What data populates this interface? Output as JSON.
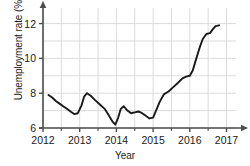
{
  "chart_data": {
    "type": "line",
    "title": "",
    "xlabel": "Year",
    "ylabel": "Unemployment rate (%)",
    "xlim": [
      2012,
      2017.15
    ],
    "ylim": [
      6,
      12.55
    ],
    "xticks": [
      2012,
      2013,
      2014,
      2015,
      2016,
      2017
    ],
    "xtick_labels": [
      "2012",
      "2013",
      "2014",
      "2015",
      "2016",
      "2017"
    ],
    "yticks": [
      6,
      8,
      10,
      12
    ],
    "ytick_labels": [
      "6",
      "8",
      "10",
      "12"
    ],
    "minor_xticks": [
      2012.5,
      2013.5,
      2014.5,
      2015.5,
      2016.5
    ],
    "grid": true,
    "legend": "none",
    "line_color": "#1a1a1a",
    "grid_color": "#d8d8d8",
    "axis_color": "#4d4d4d",
    "series": [
      {
        "name": "Unemployment rate",
        "x": [
          2012.15,
          2012.25,
          2012.35,
          2012.45,
          2012.55,
          2012.65,
          2012.75,
          2012.85,
          2012.95,
          2013.05,
          2013.12,
          2013.2,
          2013.3,
          2013.42,
          2013.55,
          2013.68,
          2013.8,
          2013.9,
          2013.97,
          2014.05,
          2014.12,
          2014.2,
          2014.3,
          2014.4,
          2014.5,
          2014.6,
          2014.7,
          2014.8,
          2014.9,
          2015.0,
          2015.08,
          2015.18,
          2015.3,
          2015.42,
          2015.55,
          2015.68,
          2015.8,
          2015.9,
          2016.0,
          2016.08,
          2016.15,
          2016.25,
          2016.35,
          2016.45,
          2016.55,
          2016.62,
          2016.7,
          2016.8
        ],
        "y": [
          7.9,
          7.75,
          7.55,
          7.4,
          7.25,
          7.1,
          6.95,
          6.8,
          6.85,
          7.3,
          7.8,
          8.0,
          7.85,
          7.6,
          7.35,
          7.1,
          6.7,
          6.35,
          6.2,
          6.6,
          7.1,
          7.25,
          7.0,
          6.85,
          6.9,
          6.95,
          6.85,
          6.7,
          6.55,
          6.6,
          7.0,
          7.5,
          7.95,
          8.1,
          8.35,
          8.6,
          8.85,
          8.95,
          9.0,
          9.3,
          9.8,
          10.5,
          11.1,
          11.4,
          11.45,
          11.65,
          11.85,
          11.9
        ]
      }
    ]
  }
}
